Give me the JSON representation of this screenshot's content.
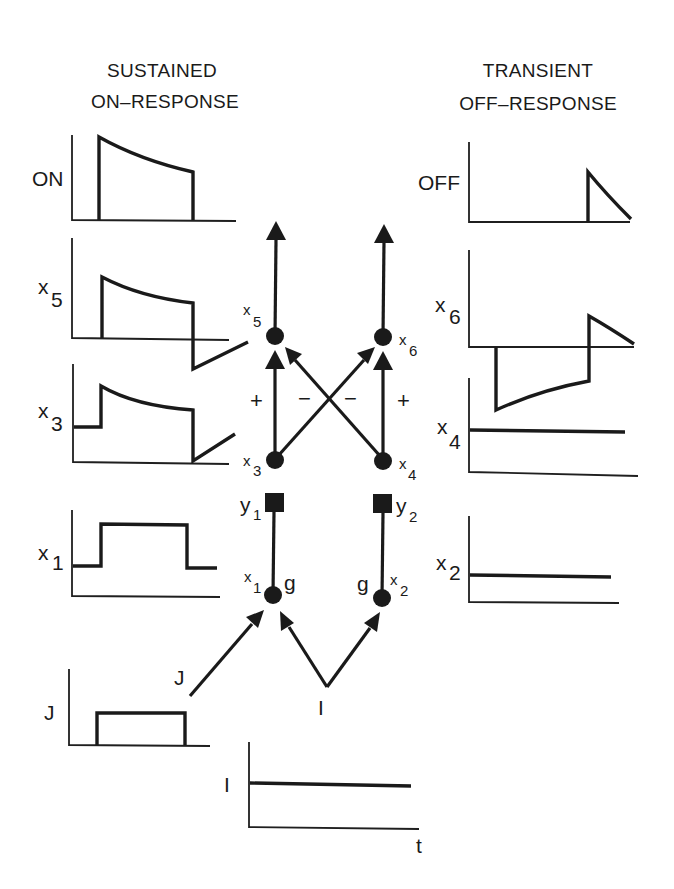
{
  "titles": {
    "left_line1": "SUSTAINED",
    "left_line2": "ON–RESPONSE",
    "right_line1": "TRANSIENT",
    "right_line2": "OFF–RESPONSE"
  },
  "plots": {
    "on": {
      "label": "ON"
    },
    "off": {
      "label": "OFF"
    },
    "x5": {
      "label": "x",
      "sub": "5"
    },
    "x6": {
      "label": "x",
      "sub": "6"
    },
    "x3": {
      "label": "x",
      "sub": "3"
    },
    "x4": {
      "label": "x",
      "sub": "4"
    },
    "x1": {
      "label": "x",
      "sub": "1"
    },
    "x2": {
      "label": "x",
      "sub": "2"
    },
    "j": {
      "label": "J"
    },
    "i": {
      "label": "I"
    },
    "time_axis": {
      "label": "t"
    }
  },
  "network": {
    "nodes": {
      "x5": {
        "label": "x",
        "sub": "5"
      },
      "x6": {
        "label": "x",
        "sub": "6"
      },
      "x3": {
        "label": "x",
        "sub": "3"
      },
      "x4": {
        "label": "x",
        "sub": "4"
      },
      "x1": {
        "label": "x",
        "sub": "1",
        "gate": "g"
      },
      "x2": {
        "label": "x",
        "sub": "2",
        "gate": "g"
      },
      "y1": {
        "label": "y",
        "sub": "1"
      },
      "y2": {
        "label": "y",
        "sub": "2"
      }
    },
    "signs": {
      "left_excitatory": "+",
      "left_inhibitory": "−",
      "right_inhibitory": "−",
      "right_excitatory": "+"
    },
    "inputs": {
      "j": "J",
      "i": "I"
    }
  },
  "colors": {
    "ink": "#1a1a1a",
    "background": "#ffffff"
  }
}
